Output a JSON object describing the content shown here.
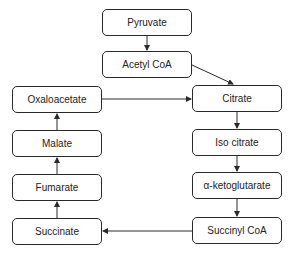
{
  "diagram": {
    "type": "flowchart",
    "nodes": {
      "pyruvate": "Pyruvate",
      "acetyl_coa": "Acetyl CoA",
      "oxaloacetate": "Oxaloacetate",
      "citrate": "Citrate",
      "malate": "Malate",
      "iso_citrate": "Iso citrate",
      "fumarate": "Fumarate",
      "alpha_ketoglutarate": "α-ketoglutarate",
      "succinate": "Succinate",
      "succinyl_coa": "Succinyl CoA"
    },
    "edges": [
      [
        "Pyruvate",
        "Acetyl CoA"
      ],
      [
        "Acetyl CoA",
        "Citrate"
      ],
      [
        "Oxaloacetate",
        "Citrate"
      ],
      [
        "Citrate",
        "Iso citrate"
      ],
      [
        "Iso citrate",
        "α-ketoglutarate"
      ],
      [
        "α-ketoglutarate",
        "Succinyl CoA"
      ],
      [
        "Succinyl CoA",
        "Succinate"
      ],
      [
        "Succinate",
        "Fumarate"
      ],
      [
        "Fumarate",
        "Malate"
      ],
      [
        "Malate",
        "Oxaloacetate"
      ]
    ],
    "colors": {
      "stroke": "#2a2a2a",
      "fill": "#ffffff",
      "text": "#222222"
    }
  }
}
